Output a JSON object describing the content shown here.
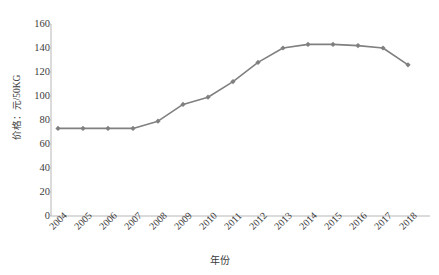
{
  "chart_data": {
    "type": "line",
    "title": "",
    "xlabel": "年份",
    "ylabel": "价格：元/50KG",
    "categories": [
      "2004",
      "2005",
      "2006",
      "2007",
      "2008",
      "2009",
      "2010",
      "2011",
      "2012",
      "2013",
      "2014",
      "2015",
      "2016",
      "2017",
      "2018"
    ],
    "values": [
      73,
      73,
      73,
      73,
      79,
      93,
      99,
      112,
      128,
      140,
      143,
      143,
      142,
      140,
      126
    ],
    "series": [
      {
        "name": "价格",
        "values": [
          73,
          73,
          73,
          73,
          79,
          93,
          99,
          112,
          128,
          140,
          143,
          143,
          142,
          140,
          126
        ]
      }
    ],
    "ylim": [
      0,
      160
    ],
    "y_ticks": [
      0,
      20,
      40,
      60,
      80,
      100,
      120,
      140,
      160
    ],
    "y_tick_labels": [
      "0",
      "20",
      "40",
      "60",
      "80",
      "100",
      "120",
      "140",
      "160"
    ],
    "x_tick_labels": [
      "2004",
      "2005",
      "2006",
      "2007",
      "2008",
      "2009",
      "2010",
      "2011",
      "2012",
      "2013",
      "2014",
      "2015",
      "2016",
      "2017",
      "2018"
    ],
    "grid": false,
    "legend": "none",
    "marker": "diamond",
    "line_color": "#808080",
    "marker_color": "#808080",
    "axis_color": "#b7b7b7",
    "text_color": "#3b3b3b",
    "background_color": "#ffffff"
  }
}
